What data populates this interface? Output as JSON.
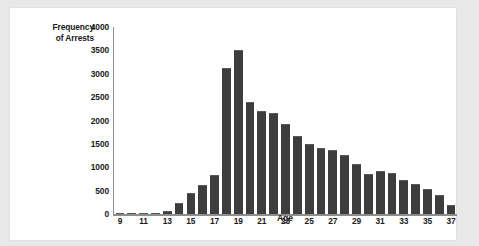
{
  "chart_data": {
    "type": "bar",
    "title": "",
    "xlabel": "Age",
    "ylabel": "Frequency of Arrests",
    "ylabel_line1": "Frequency",
    "ylabel_line2": "of Arrests",
    "categories": [
      9,
      10,
      11,
      12,
      13,
      14,
      15,
      16,
      17,
      18,
      19,
      20,
      21,
      22,
      23,
      24,
      25,
      26,
      27,
      28,
      29,
      30,
      31,
      32,
      33,
      34,
      35,
      36,
      37
    ],
    "values": [
      0,
      0,
      10,
      30,
      60,
      235,
      440,
      630,
      840,
      3130,
      3500,
      2390,
      2200,
      2165,
      1930,
      1670,
      1490,
      1415,
      1365,
      1255,
      1075,
      855,
      910,
      885,
      730,
      640,
      540,
      415,
      195
    ],
    "xtick_labels": [
      "9",
      "",
      "11",
      "",
      "13",
      "",
      "15",
      "",
      "17",
      "",
      "19",
      "",
      "21",
      "",
      "23",
      "",
      "25",
      "",
      "27",
      "",
      "29",
      "",
      "31",
      "",
      "33",
      "",
      "35",
      "",
      "37"
    ],
    "ytick_labels": [
      "0",
      "500",
      "1000",
      "1500",
      "2000",
      "2500",
      "3000",
      "3500",
      "4000"
    ],
    "ytick_values": [
      0,
      500,
      1000,
      1500,
      2000,
      2500,
      3000,
      3500,
      4000
    ],
    "ylim": [
      0,
      4000
    ],
    "xlim": [
      9,
      37
    ],
    "grid": false,
    "legend": null,
    "bar_color": "#3d3d3d",
    "axis_color": "#8d8d8d",
    "plot_background": "#ffffff",
    "page_background": "#e9e9e9"
  }
}
